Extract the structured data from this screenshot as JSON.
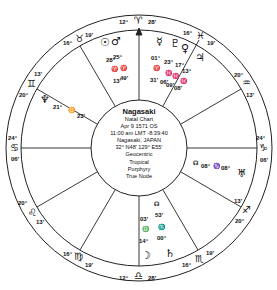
{
  "chart_info": {
    "name": "Nagasaki",
    "type": "Natal Chart",
    "date": "Apr 9 1571 OS",
    "time": "11:00 am  LMT -8:39:40",
    "place": "Nagasaki, JAPAN",
    "coords": "32°  N48' 129°  E55'",
    "system1": "Geocentric",
    "system2": "Tropical",
    "house_system": "Porphyry",
    "node": "True Node"
  },
  "cusps": [
    {
      "id": "mc",
      "deg": "12°",
      "sign": "♈",
      "min": "28'"
    },
    {
      "id": "c11",
      "deg": "16°",
      "sign": "♉",
      "min": "19'"
    },
    {
      "id": "c12",
      "deg": "20°",
      "sign": "♊",
      "min": "13'"
    },
    {
      "id": "asc",
      "deg": "24°",
      "sign": "♋",
      "min": "06'"
    },
    {
      "id": "c2",
      "deg": "20°",
      "sign": "♌",
      "min": "13'"
    },
    {
      "id": "c3",
      "deg": "16°",
      "sign": "♍",
      "min": "19'"
    },
    {
      "id": "ic",
      "deg": "12°",
      "sign": "♎",
      "min": "28'"
    },
    {
      "id": "c5",
      "deg": "16°",
      "sign": "♏",
      "min": "19'"
    },
    {
      "id": "c6",
      "deg": "20°",
      "sign": "♐",
      "min": "13'"
    },
    {
      "id": "dsc",
      "deg": "24°",
      "sign": "♑",
      "min": "06'"
    },
    {
      "id": "c8",
      "deg": "20°",
      "sign": "♒",
      "min": "13'"
    },
    {
      "id": "c9",
      "deg": "16°",
      "sign": "♓",
      "min": "19'"
    }
  ],
  "planets": {
    "sun": {
      "glyph": "☉",
      "deg": "28°",
      "sign": "♈",
      "min": "13'"
    },
    "mars": {
      "glyph": "♂",
      "deg": "25°",
      "sign": "♈",
      "min": "49'"
    },
    "mercury": {
      "glyph": "☿",
      "deg": "01°",
      "sign": "♈",
      "min": "31'"
    },
    "pluto": {
      "glyph": "♇",
      "deg": "23°",
      "sign": "♓",
      "min": "06'"
    },
    "venus": {
      "glyph": "♀",
      "deg": "17°",
      "sign": "♓",
      "min": "09'"
    },
    "jupiter": {
      "glyph": "♃",
      "deg": "13°",
      "sign": "♓",
      "min": "08'"
    },
    "neptune": {
      "glyph": "♆",
      "deg": "21°",
      "sign": "♊",
      "min": "23'"
    },
    "node": {
      "glyph": "☊",
      "deg": "08°",
      "sign": "♑",
      "min": "08°"
    },
    "uranus": {
      "glyph": "♅",
      "label": ""
    },
    "saturn": {
      "glyph": "♄",
      "label": ""
    },
    "moon": {
      "glyph": "☽",
      "deg": "14°",
      "sign": "♎",
      "min": "03'"
    },
    "chiron": {
      "glyph": "☊",
      "deg": "00°",
      "sign": "♏",
      "min": "53'"
    }
  }
}
